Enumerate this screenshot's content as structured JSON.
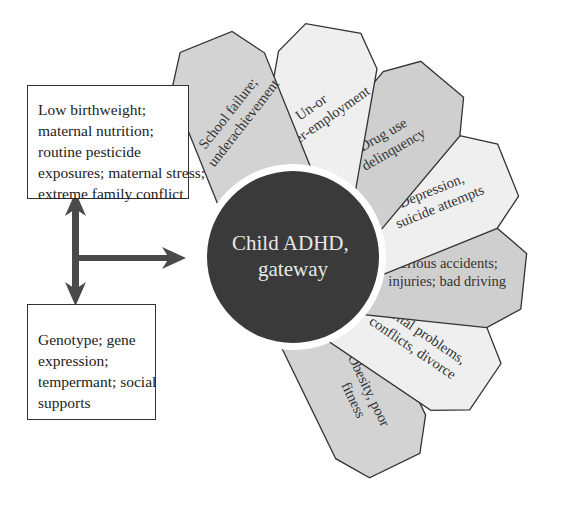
{
  "diagram": {
    "center": {
      "line1": "Child ADHD,",
      "line2": "gateway",
      "fill": "#3a3a3a",
      "text_color": "#e8e8e8"
    },
    "left_boxes": {
      "top": {
        "lines": [
          "Low birthweight;",
          "maternal nutrition;",
          "routine pesticide",
          "exposures; maternal stress;",
          "extreme family conflict"
        ]
      },
      "bottom": {
        "lines": [
          "Genotype; gene",
          "expression;",
          "tempermant; social",
          "supports"
        ]
      }
    },
    "arrow_color": "#4a4a4a",
    "petals": [
      {
        "lines": [
          "School failure;",
          "underachievement"
        ],
        "fill": "#d3d3d3"
      },
      {
        "lines": [
          "Un-or",
          "under-employment"
        ],
        "fill": "#efefef"
      },
      {
        "lines": [
          "Drug use",
          "delinquency"
        ],
        "fill": "#cfcfcf"
      },
      {
        "lines": [
          "Depression,",
          "suicide attempts"
        ],
        "fill": "#efefef"
      },
      {
        "lines": [
          "Serious accidents;",
          "injuries; bad driving"
        ],
        "fill": "#cfcfcf"
      },
      {
        "lines": [
          "Marital problems,",
          "conflicts, divorce"
        ],
        "fill": "#efefef"
      },
      {
        "lines": [
          "Obesity, poor",
          "fitness"
        ],
        "fill": "#d3d3d3"
      }
    ]
  }
}
